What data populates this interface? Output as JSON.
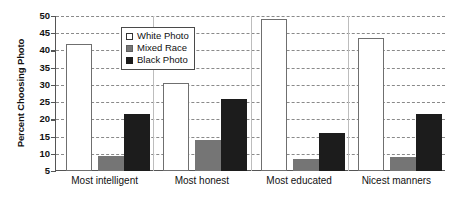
{
  "chart_data": {
    "type": "bar",
    "title": "",
    "xlabel": "",
    "ylabel": "Percent Choosing Photo",
    "ylim": [
      5,
      50
    ],
    "ytick_step": 5,
    "yticks": [
      50,
      45,
      40,
      35,
      30,
      25,
      20,
      15,
      10,
      5
    ],
    "grid": true,
    "grid_style": "dashed-horizontal",
    "legend_position": "inside-top-center",
    "categories": [
      "Most intelligent",
      "Most honest",
      "Most educated",
      "Nicest manners"
    ],
    "series": [
      {
        "name": "White Photo",
        "color": "#ffffff",
        "values": [
          42,
          30.5,
          49,
          43.5
        ]
      },
      {
        "name": "Mixed Race",
        "color": "#757575",
        "values": [
          9.5,
          14,
          8.5,
          9
        ]
      },
      {
        "name": "Black Photo",
        "color": "#1c1c1c",
        "values": [
          21.5,
          26,
          16,
          21.5
        ]
      }
    ]
  },
  "legend": {
    "items": [
      {
        "label": "White Photo",
        "swatch": "white"
      },
      {
        "label": "Mixed Race",
        "swatch": "gray"
      },
      {
        "label": "Black Photo",
        "swatch": "black"
      }
    ]
  },
  "colors": {
    "white_photo": "#ffffff",
    "mixed_race": "#757575",
    "black_photo": "#1c1c1c",
    "axis": "#555555",
    "gridline": "#8a8a8a"
  }
}
